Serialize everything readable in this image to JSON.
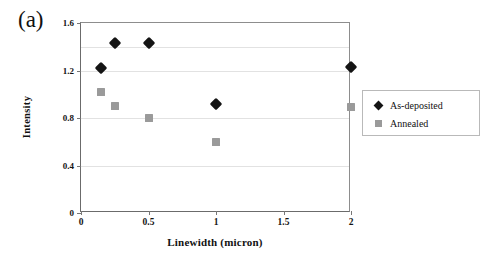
{
  "figure": {
    "panel_label": "(a)"
  },
  "legend": {
    "position": "right",
    "entries": [
      {
        "label": "As-deposited",
        "marker": "diamond-marker-icon",
        "color": "#141414"
      },
      {
        "label": "Annealed",
        "marker": "square-marker-icon",
        "color": "#9a9a9a"
      }
    ]
  },
  "axes": {
    "x": {
      "label": "Linewidth (micron)",
      "ticks": [
        "0",
        "0.5",
        "1",
        "1.5",
        "2"
      ],
      "tick_values": [
        0,
        0.5,
        1,
        1.5,
        2
      ],
      "min": 0,
      "max": 2
    },
    "y": {
      "label": "Intensity",
      "ticks": [
        "0",
        "0.4",
        "0.8",
        "1.2",
        "1.6"
      ],
      "tick_values": [
        0,
        0.4,
        0.8,
        1.2,
        1.6
      ],
      "min": 0,
      "max": 1.6
    }
  },
  "chart_data": {
    "type": "scatter",
    "title": "",
    "subtitle": "",
    "annotations": [
      "(a)"
    ],
    "xlabel": "Linewidth (micron)",
    "ylabel": "Intensity",
    "xlim": [
      0,
      2
    ],
    "ylim": [
      0,
      1.6
    ],
    "xticks": [
      0,
      0.5,
      1,
      1.5,
      2
    ],
    "yticks": [
      0,
      0.4,
      0.8,
      1.2,
      1.6
    ],
    "grid": "horizontal",
    "gridline_values": [
      0.4,
      0.8,
      1.2,
      1.4
    ],
    "legend_position": "right",
    "series": [
      {
        "name": "As-deposited",
        "marker": "diamond",
        "color": "#141414",
        "points": [
          {
            "x": 0.15,
            "y": 1.22
          },
          {
            "x": 0.25,
            "y": 1.43
          },
          {
            "x": 0.5,
            "y": 1.43
          },
          {
            "x": 1.0,
            "y": 0.92
          },
          {
            "x": 2.0,
            "y": 1.23
          }
        ]
      },
      {
        "name": "Annealed",
        "marker": "square",
        "color": "#9a9a9a",
        "points": [
          {
            "x": 0.15,
            "y": 1.02
          },
          {
            "x": 0.25,
            "y": 0.9
          },
          {
            "x": 0.5,
            "y": 0.8
          },
          {
            "x": 1.0,
            "y": 0.6
          },
          {
            "x": 2.0,
            "y": 0.89
          }
        ]
      }
    ]
  }
}
